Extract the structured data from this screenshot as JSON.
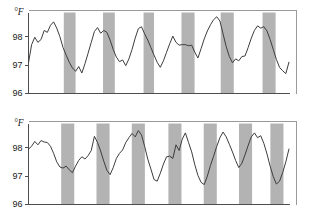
{
  "figure": {
    "title": "",
    "unit_label": "°F",
    "panel_count": 2
  },
  "chart_data": [
    {
      "type": "line",
      "title": "",
      "subject": "Panel A",
      "xlabel": "",
      "ylabel": "°F",
      "unit": "°F",
      "grid": false,
      "legend": "none",
      "ylim": [
        96,
        98.85
      ],
      "yticks": [
        96,
        97,
        98
      ],
      "ytick_labels": [
        "96",
        "97",
        "98"
      ],
      "xlim": [
        0,
        100
      ],
      "xticks": [],
      "xtick_labels": [],
      "shaded_bands_label": "sleep period",
      "shaded_band_color": "#b3b3b3",
      "line_color": "#3d3d3d",
      "shaded_bands": [
        {
          "x0": 13.5,
          "x1": 18.0
        },
        {
          "x0": 28.5,
          "x1": 33.0
        },
        {
          "x0": 44.0,
          "x1": 48.0
        },
        {
          "x0": 58.5,
          "x1": 63.5
        },
        {
          "x0": 73.5,
          "x1": 78.5
        },
        {
          "x0": 89.5,
          "x1": 94.5
        }
      ],
      "x": [
        0.0,
        1.2,
        2.4,
        3.6,
        4.8,
        6.0,
        7.2,
        8.4,
        9.6,
        10.8,
        12.0,
        13.2,
        14.4,
        15.6,
        16.8,
        18.0,
        19.2,
        20.4,
        21.6,
        22.8,
        24.0,
        25.2,
        26.4,
        27.6,
        28.8,
        30.0,
        31.2,
        32.4,
        33.6,
        34.8,
        36.0,
        37.2,
        38.4,
        39.6,
        40.8,
        42.0,
        43.2,
        44.4,
        45.6,
        46.8,
        48.0,
        49.2,
        50.4,
        51.6,
        52.8,
        54.0,
        55.2,
        56.4,
        57.6,
        58.8,
        60.0,
        61.2,
        62.4,
        63.6,
        64.8,
        66.0,
        67.2,
        68.4,
        69.6,
        70.8,
        72.0,
        73.2,
        74.4,
        75.6,
        76.8,
        78.0,
        79.2,
        80.4,
        81.6,
        82.8,
        84.0,
        85.2,
        86.4,
        87.6,
        88.8,
        90.0,
        91.2,
        92.4,
        93.6,
        94.8,
        96.0,
        97.2,
        98.4,
        99.6
      ],
      "values": [
        97.08,
        97.72,
        97.98,
        97.8,
        97.9,
        98.22,
        98.15,
        98.4,
        98.52,
        98.3,
        98.0,
        97.62,
        97.35,
        97.1,
        96.9,
        96.78,
        96.95,
        96.72,
        97.05,
        97.42,
        97.8,
        98.18,
        98.32,
        98.12,
        98.22,
        98.15,
        97.88,
        97.55,
        97.28,
        97.12,
        97.18,
        96.98,
        97.22,
        97.55,
        97.95,
        98.28,
        98.35,
        98.1,
        97.88,
        97.62,
        97.35,
        97.1,
        96.92,
        97.15,
        97.45,
        97.75,
        98.02,
        97.8,
        97.7,
        97.72,
        97.72,
        97.68,
        97.7,
        97.45,
        97.25,
        97.58,
        97.92,
        98.2,
        98.42,
        98.6,
        98.7,
        98.55,
        98.1,
        97.65,
        97.3,
        97.08,
        97.22,
        97.15,
        97.3,
        97.32,
        97.62,
        97.95,
        98.22,
        98.38,
        98.3,
        98.35,
        98.2,
        97.9,
        97.55,
        97.2,
        96.92,
        96.8,
        96.7,
        97.1
      ]
    },
    {
      "type": "line",
      "title": "",
      "subject": "Panel B",
      "xlabel": "",
      "ylabel": "°F",
      "unit": "°F",
      "grid": false,
      "legend": "none",
      "ylim": [
        96,
        98.85
      ],
      "yticks": [
        96,
        97,
        98
      ],
      "ytick_labels": [
        "96",
        "97",
        "98"
      ],
      "xlim": [
        0,
        100
      ],
      "xticks": [],
      "xtick_labels": [],
      "shaded_bands_label": "sleep period",
      "shaded_band_color": "#b3b3b3",
      "line_color": "#3d3d3d",
      "shaded_bands": [
        {
          "x0": 12.5,
          "x1": 17.5
        },
        {
          "x0": 26.0,
          "x1": 31.0
        },
        {
          "x0": 39.5,
          "x1": 44.5
        },
        {
          "x0": 53.5,
          "x1": 58.5
        },
        {
          "x0": 67.0,
          "x1": 72.0
        },
        {
          "x0": 80.5,
          "x1": 85.5
        },
        {
          "x0": 92.5,
          "x1": 97.5
        }
      ],
      "x": [
        0.0,
        1.2,
        2.4,
        3.6,
        4.8,
        6.0,
        7.2,
        8.4,
        9.6,
        10.8,
        12.0,
        13.2,
        14.4,
        15.6,
        16.8,
        18.0,
        19.2,
        20.4,
        21.6,
        22.8,
        24.0,
        25.2,
        26.4,
        27.6,
        28.8,
        30.0,
        31.2,
        32.4,
        33.6,
        34.8,
        36.0,
        37.2,
        38.4,
        39.6,
        40.8,
        42.0,
        43.2,
        44.4,
        45.6,
        46.8,
        48.0,
        49.2,
        50.4,
        51.6,
        52.8,
        54.0,
        55.2,
        56.4,
        57.6,
        58.8,
        60.0,
        61.2,
        62.4,
        63.6,
        64.8,
        66.0,
        67.2,
        68.4,
        69.6,
        70.8,
        72.0,
        73.2,
        74.4,
        75.6,
        76.8,
        78.0,
        79.2,
        80.4,
        81.6,
        82.8,
        84.0,
        85.2,
        86.4,
        87.6,
        88.8,
        90.0,
        91.2,
        92.4,
        93.6,
        94.8,
        96.0,
        97.2,
        98.4,
        99.6
      ],
      "values": [
        97.95,
        98.05,
        98.22,
        98.1,
        98.25,
        98.2,
        98.18,
        98.05,
        97.8,
        97.5,
        97.32,
        97.28,
        97.35,
        97.22,
        97.12,
        97.35,
        97.55,
        97.68,
        97.6,
        97.72,
        97.9,
        98.4,
        98.18,
        97.88,
        97.52,
        97.2,
        97.05,
        97.3,
        97.62,
        97.8,
        97.92,
        98.18,
        98.35,
        98.5,
        98.38,
        98.6,
        98.45,
        98.05,
        97.6,
        97.25,
        96.88,
        96.82,
        97.1,
        97.42,
        97.68,
        97.7,
        97.62,
        98.1,
        97.9,
        98.3,
        98.52,
        98.18,
        97.85,
        97.4,
        97.02,
        96.78,
        96.7,
        97.0,
        97.38,
        97.7,
        98.05,
        98.35,
        98.55,
        98.38,
        98.12,
        97.85,
        97.55,
        97.3,
        97.45,
        97.75,
        98.08,
        98.38,
        98.52,
        98.35,
        98.42,
        98.15,
        97.78,
        97.35,
        96.98,
        96.72,
        96.82,
        97.12,
        97.5,
        97.95
      ]
    }
  ]
}
